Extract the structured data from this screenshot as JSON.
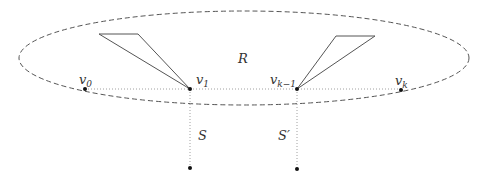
{
  "diagram": {
    "region": {
      "label": "R",
      "shape": "dashed-ellipse",
      "cx": 244,
      "cy": 58,
      "rx": 225,
      "ry": 47,
      "stroke": "#555555"
    },
    "path_line": {
      "style": "dotted",
      "stroke": "#999999",
      "from": [
        85,
        89
      ],
      "to": [
        401,
        89
      ]
    },
    "vertices": [
      {
        "id": "v0",
        "base": "v",
        "sub": "0",
        "x": 85,
        "y": 89,
        "label_x": 79,
        "label_y": 84
      },
      {
        "id": "v1",
        "base": "v",
        "sub": "1",
        "x": 190,
        "y": 89,
        "label_x": 196,
        "label_y": 84
      },
      {
        "id": "vk-1",
        "base": "v",
        "sub": "k−1",
        "x": 297,
        "y": 89,
        "label_x": 271,
        "label_y": 84
      },
      {
        "id": "vk",
        "base": "v",
        "sub": "k",
        "x": 401,
        "y": 90,
        "label_x": 395,
        "label_y": 85
      }
    ],
    "triangles": [
      {
        "id": "left-triangle",
        "points": [
          [
            99,
            34
          ],
          [
            138,
            34
          ],
          [
            190,
            89
          ]
        ],
        "stroke": "#555555"
      },
      {
        "id": "right-triangle",
        "points": [
          [
            336,
            36
          ],
          [
            375,
            36
          ],
          [
            297,
            89
          ]
        ],
        "stroke": "#555555"
      }
    ],
    "segments": [
      {
        "id": "S",
        "label": "S",
        "x": 190,
        "y1": 89,
        "y2": 168,
        "label_x": 198,
        "label_y": 137,
        "end_dot": [
          190,
          168
        ]
      },
      {
        "id": "S-prime",
        "label": "S′",
        "x": 297,
        "y1": 89,
        "y2": 169,
        "label_x": 278,
        "label_y": 137,
        "end_dot": [
          297,
          169
        ]
      }
    ],
    "colors": {
      "dot": "#111111",
      "text": "#333333",
      "dotted": "#a0a0a0"
    }
  }
}
